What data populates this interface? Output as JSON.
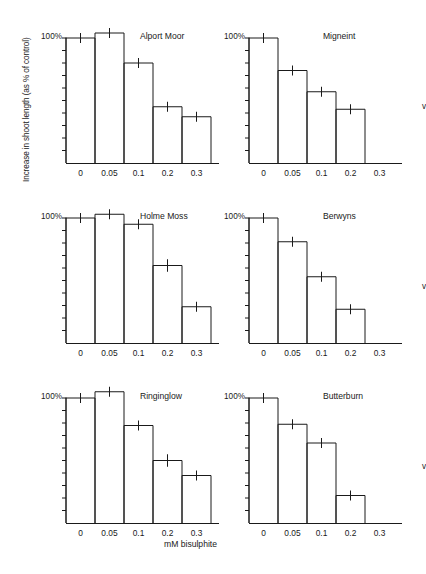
{
  "figure": {
    "ylabel": "Increase in shoot length (as % of control)",
    "xlabel": "mM bisulphite",
    "axis_top_label": "100%",
    "v_marker": "v"
  },
  "chart_data": {
    "type": "bar",
    "title": "",
    "xlabel": "mM bisulphite",
    "ylabel": "Increase in shoot length (as % of control)",
    "ylim": [
      0,
      110
    ],
    "y_ticklabels": [
      "100%"
    ],
    "y_tick_values": [
      0,
      10,
      20,
      30,
      40,
      50,
      60,
      70,
      80,
      90,
      100
    ],
    "categories": [
      "0",
      "0.05",
      "0.1",
      "0.2",
      "0.3"
    ],
    "grid": false,
    "legend": null,
    "error_bars": "vertical tick markers at bar tops",
    "panels": [
      {
        "name": "Alport Moor",
        "row": 0,
        "col": 0,
        "v_marker": false,
        "categories": [
          "0",
          "0.05",
          "0.1",
          "0.2",
          "0.3"
        ],
        "values": [
          100,
          104,
          80,
          45,
          37
        ],
        "errors": [
          4,
          4,
          4,
          3,
          3
        ]
      },
      {
        "name": "Migneint",
        "row": 0,
        "col": 1,
        "v_marker": true,
        "categories": [
          "0",
          "0.05",
          "0.1",
          "0.2",
          "0.3"
        ],
        "values": [
          100,
          74,
          57,
          43,
          0
        ],
        "errors": [
          4,
          4,
          3,
          4,
          0
        ]
      },
      {
        "name": "Holme Moss",
        "row": 1,
        "col": 0,
        "v_marker": false,
        "categories": [
          "0",
          "0.05",
          "0.1",
          "0.2",
          "0.3"
        ],
        "values": [
          100,
          103,
          95,
          62,
          29
        ],
        "errors": [
          4,
          3,
          4,
          5,
          4
        ]
      },
      {
        "name": "Berwyns",
        "row": 1,
        "col": 1,
        "v_marker": true,
        "categories": [
          "0",
          "0.05",
          "0.1",
          "0.2",
          "0.3"
        ],
        "values": [
          100,
          81,
          53,
          27,
          0
        ],
        "errors": [
          4,
          4,
          3,
          4,
          0
        ]
      },
      {
        "name": "Ringinglow",
        "row": 2,
        "col": 0,
        "v_marker": false,
        "categories": [
          "0",
          "0.05",
          "0.1",
          "0.2",
          "0.3"
        ],
        "values": [
          100,
          105,
          78,
          50,
          38
        ],
        "errors": [
          4,
          4,
          4,
          5,
          4
        ]
      },
      {
        "name": "Butterburn",
        "row": 2,
        "col": 1,
        "v_marker": true,
        "categories": [
          "0",
          "0.05",
          "0.1",
          "0.2",
          "0.3"
        ],
        "values": [
          100,
          79,
          64,
          22,
          0
        ],
        "errors": [
          4,
          4,
          4,
          4,
          0
        ]
      }
    ]
  }
}
